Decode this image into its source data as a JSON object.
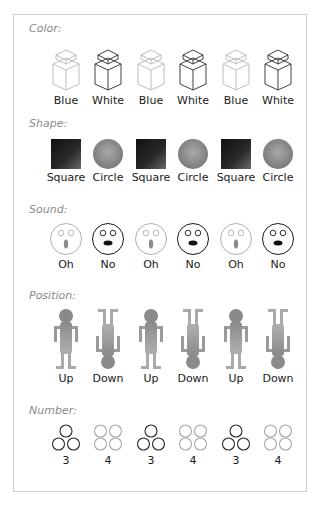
{
  "sections": [
    {
      "title": "Color:",
      "items": [
        {
          "label": "Blue",
          "icon": "cube-light-icon",
          "variant": "blue"
        },
        {
          "label": "White",
          "icon": "cube-dark-icon",
          "variant": "white"
        },
        {
          "label": "Blue",
          "icon": "cube-light-icon",
          "variant": "blue"
        },
        {
          "label": "White",
          "icon": "cube-dark-icon",
          "variant": "white"
        },
        {
          "label": "Blue",
          "icon": "cube-light-icon",
          "variant": "blue"
        },
        {
          "label": "White",
          "icon": "cube-dark-icon",
          "variant": "white"
        }
      ]
    },
    {
      "title": "Shape:",
      "items": [
        {
          "label": "Square",
          "icon": "square-icon"
        },
        {
          "label": "Circle",
          "icon": "circle-icon"
        },
        {
          "label": "Square",
          "icon": "square-icon"
        },
        {
          "label": "Circle",
          "icon": "circle-icon"
        },
        {
          "label": "Square",
          "icon": "square-icon"
        },
        {
          "label": "Circle",
          "icon": "circle-icon"
        }
      ]
    },
    {
      "title": "Sound:",
      "items": [
        {
          "label": "Oh",
          "icon": "face-oh-icon"
        },
        {
          "label": "No",
          "icon": "face-no-icon"
        },
        {
          "label": "Oh",
          "icon": "face-oh-icon"
        },
        {
          "label": "No",
          "icon": "face-no-icon"
        },
        {
          "label": "Oh",
          "icon": "face-oh-icon"
        },
        {
          "label": "No",
          "icon": "face-no-icon"
        }
      ]
    },
    {
      "title": "Position:",
      "items": [
        {
          "label": "Up",
          "icon": "figure-up-icon"
        },
        {
          "label": "Down",
          "icon": "figure-down-icon"
        },
        {
          "label": "Up",
          "icon": "figure-up-icon"
        },
        {
          "label": "Down",
          "icon": "figure-down-icon"
        },
        {
          "label": "Up",
          "icon": "figure-up-icon"
        },
        {
          "label": "Down",
          "icon": "figure-down-icon"
        }
      ]
    },
    {
      "title": "Number:",
      "items": [
        {
          "label": "3",
          "icon": "three-circles-icon"
        },
        {
          "label": "4",
          "icon": "four-circles-icon"
        },
        {
          "label": "3",
          "icon": "three-circles-icon"
        },
        {
          "label": "4",
          "icon": "four-circles-icon"
        },
        {
          "label": "3",
          "icon": "three-circles-icon"
        },
        {
          "label": "4",
          "icon": "four-circles-icon"
        }
      ]
    }
  ],
  "colors": {
    "border": "#cfcfcf",
    "title": "#8a8a8a",
    "light_stroke": "#b5b5b5",
    "dark_stroke": "#222222",
    "figure_gray": "#8f8f8f"
  }
}
